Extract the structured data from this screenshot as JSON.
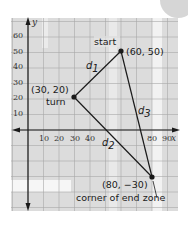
{
  "figure": {
    "axes": {
      "x_label": "x",
      "y_label": "y",
      "x_ticks": [
        "10",
        "20",
        "30",
        "40",
        "80",
        "90"
      ],
      "y_ticks": [
        "60",
        "50",
        "40",
        "30",
        "20",
        "10"
      ]
    },
    "points": [
      {
        "id": "start",
        "label": "start",
        "coords": "(60, 50)",
        "x": 60,
        "y": 50
      },
      {
        "id": "turn",
        "label": "turn",
        "coords": "(30, 20)",
        "x": 30,
        "y": 20
      },
      {
        "id": "corner",
        "label": "corner of end zone",
        "coords": "(80, −30)",
        "x": 80,
        "y": -30
      }
    ],
    "segments": [
      {
        "name": "d",
        "sub": "1",
        "from": "start",
        "to": "turn"
      },
      {
        "name": "d",
        "sub": "2",
        "from": "turn",
        "to": "corner"
      },
      {
        "name": "d",
        "sub": "3",
        "from": "start",
        "to": "corner"
      }
    ],
    "colors": {
      "grid_bg": "#dcdcdc",
      "grid_line": "#9a9a9a",
      "band": "#f4f4f4",
      "line": "#1a1a1a"
    }
  }
}
